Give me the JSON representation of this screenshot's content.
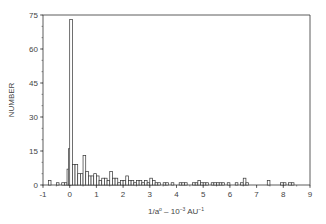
{
  "chart_data": {
    "type": "bar",
    "title": "",
    "xlabel": "1/a⁰ – 10⁻³ AU⁻¹",
    "ylabel": "NUMBER",
    "xlim": [
      -1,
      9
    ],
    "ylim": [
      0,
      75
    ],
    "xticks": [
      -1,
      0,
      1,
      2,
      3,
      4,
      5,
      6,
      7,
      8,
      9
    ],
    "yticks": [
      0,
      15,
      30,
      45,
      60,
      75
    ],
    "grid": false,
    "legend": null,
    "bin_width": 0.1,
    "bins": [
      {
        "x": -0.8,
        "v": 2
      },
      {
        "x": -0.5,
        "v": 1
      },
      {
        "x": -0.3,
        "v": 1
      },
      {
        "x": -0.2,
        "v": 1
      },
      {
        "x": -0.1,
        "v": 7
      },
      {
        "x": -0.05,
        "v": 16
      },
      {
        "x": 0.0,
        "v": 73
      },
      {
        "x": 0.1,
        "v": 9
      },
      {
        "x": 0.2,
        "v": 9
      },
      {
        "x": 0.3,
        "v": 5
      },
      {
        "x": 0.4,
        "v": 5
      },
      {
        "x": 0.5,
        "v": 13
      },
      {
        "x": 0.6,
        "v": 6
      },
      {
        "x": 0.7,
        "v": 4
      },
      {
        "x": 0.8,
        "v": 4
      },
      {
        "x": 0.9,
        "v": 5
      },
      {
        "x": 1.0,
        "v": 4
      },
      {
        "x": 1.1,
        "v": 2
      },
      {
        "x": 1.2,
        "v": 3
      },
      {
        "x": 1.3,
        "v": 3
      },
      {
        "x": 1.4,
        "v": 2
      },
      {
        "x": 1.5,
        "v": 6
      },
      {
        "x": 1.6,
        "v": 3
      },
      {
        "x": 1.7,
        "v": 3
      },
      {
        "x": 1.8,
        "v": 1
      },
      {
        "x": 1.9,
        "v": 2
      },
      {
        "x": 2.0,
        "v": 2
      },
      {
        "x": 2.1,
        "v": 4
      },
      {
        "x": 2.2,
        "v": 2
      },
      {
        "x": 2.3,
        "v": 2
      },
      {
        "x": 2.4,
        "v": 1
      },
      {
        "x": 2.5,
        "v": 2
      },
      {
        "x": 2.6,
        "v": 2
      },
      {
        "x": 2.7,
        "v": 1
      },
      {
        "x": 2.8,
        "v": 2
      },
      {
        "x": 2.9,
        "v": 1
      },
      {
        "x": 3.0,
        "v": 3
      },
      {
        "x": 3.1,
        "v": 2
      },
      {
        "x": 3.2,
        "v": 1
      },
      {
        "x": 3.3,
        "v": 1
      },
      {
        "x": 3.5,
        "v": 1
      },
      {
        "x": 3.6,
        "v": 1
      },
      {
        "x": 3.8,
        "v": 1
      },
      {
        "x": 4.1,
        "v": 1
      },
      {
        "x": 4.2,
        "v": 1
      },
      {
        "x": 4.3,
        "v": 1
      },
      {
        "x": 4.6,
        "v": 1
      },
      {
        "x": 4.7,
        "v": 1
      },
      {
        "x": 4.8,
        "v": 2
      },
      {
        "x": 4.9,
        "v": 1
      },
      {
        "x": 5.0,
        "v": 1
      },
      {
        "x": 5.1,
        "v": 1
      },
      {
        "x": 5.3,
        "v": 1
      },
      {
        "x": 5.4,
        "v": 1
      },
      {
        "x": 5.5,
        "v": 1
      },
      {
        "x": 5.6,
        "v": 1
      },
      {
        "x": 5.7,
        "v": 1
      },
      {
        "x": 5.9,
        "v": 1
      },
      {
        "x": 6.2,
        "v": 1
      },
      {
        "x": 6.4,
        "v": 1
      },
      {
        "x": 6.5,
        "v": 3
      },
      {
        "x": 6.6,
        "v": 1
      },
      {
        "x": 7.4,
        "v": 2
      },
      {
        "x": 7.9,
        "v": 1
      },
      {
        "x": 8.0,
        "v": 1
      },
      {
        "x": 8.2,
        "v": 1
      },
      {
        "x": 8.3,
        "v": 1
      }
    ]
  },
  "axes": {
    "ylabel": "NUMBER",
    "xlabel_main": "1/a",
    "xlabel_sup1": "o",
    "xlabel_mid": " – 10",
    "xlabel_sup2": "−3",
    "xlabel_unit": " AU",
    "xlabel_sup3": "−1"
  },
  "style": {
    "bar_stroke": "#333333",
    "bar_fill": "#ffffff",
    "axis_color": "#333333"
  }
}
